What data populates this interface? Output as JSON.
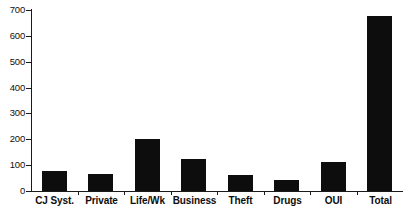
{
  "chart_data": {
    "type": "bar",
    "title": "",
    "subtitle": "",
    "xlabel": "",
    "ylabel": "",
    "categories": [
      "CJ Syst.",
      "Private",
      "Life/Wk",
      "Business",
      "Theft",
      "Drugs",
      "OUI",
      "Total"
    ],
    "values": [
      78,
      65,
      202,
      123,
      62,
      43,
      112,
      675
    ],
    "ylim": [
      0,
      700
    ],
    "yticks": [
      0,
      100,
      200,
      300,
      400,
      500,
      600,
      700
    ],
    "ytick_labels": [
      "0",
      "100",
      "200",
      "300",
      "400",
      "500",
      "600",
      "700"
    ],
    "grid": false,
    "legend": null,
    "legend_position": "none",
    "bar_color": "#0d0d0d",
    "axis_color": "#1a1a1a",
    "background_color": "#ffffff",
    "annotations": []
  }
}
